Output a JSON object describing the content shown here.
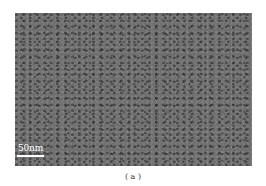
{
  "figure": {
    "image": {
      "type": "electron micrograph",
      "description": "grayscale textured nanoparticle micrograph"
    },
    "scale_bar": {
      "label": "50nm"
    },
    "caption": "( a )"
  }
}
